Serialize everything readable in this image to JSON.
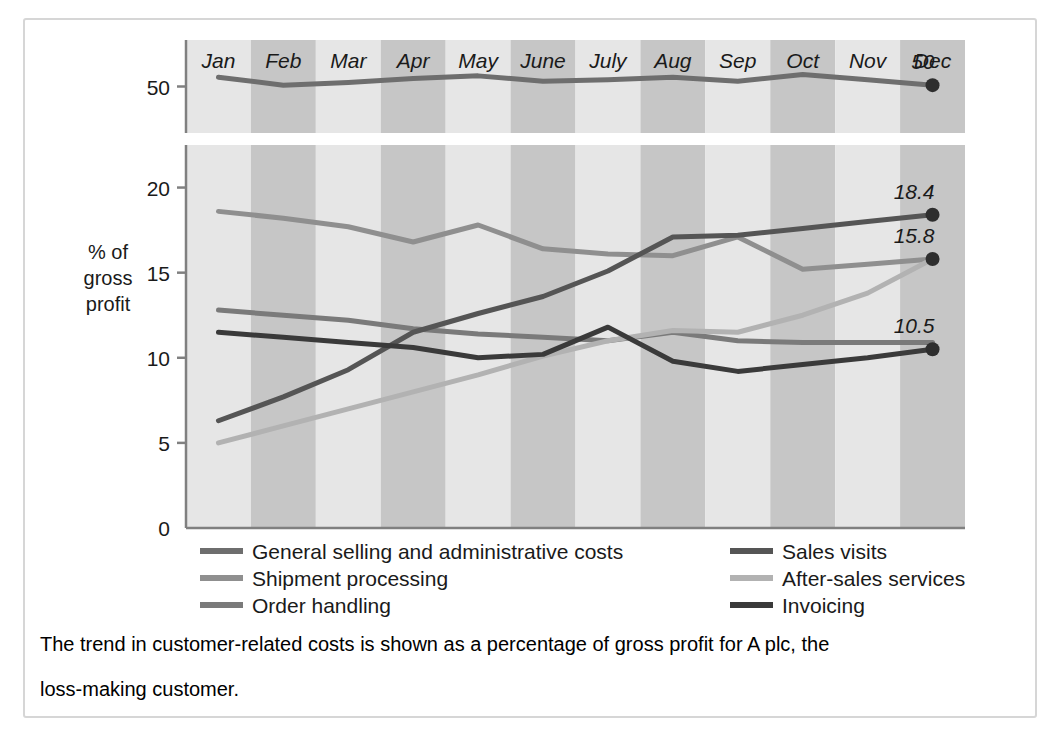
{
  "frame": {
    "border_color": "#d6d6d6",
    "background": "#ffffff"
  },
  "chart_data": {
    "type": "line",
    "title": "",
    "xlabel": "",
    "ylabel": "% of gross profit",
    "ylabel_lines": [
      "% of",
      "gross",
      "profit"
    ],
    "categories": [
      "Jan",
      "Feb",
      "Mar",
      "Apr",
      "May",
      "June",
      "July",
      "Aug",
      "Sep",
      "Oct",
      "Nov",
      "Dec"
    ],
    "grid": false,
    "legend_position": "bottom",
    "broken_axis": true,
    "upper_panel": {
      "ticks": [
        50
      ],
      "ymin": 46.5,
      "ymax": 53.5
    },
    "lower_panel": {
      "ticks": [
        0,
        5,
        10,
        15,
        20
      ],
      "ymin": 0,
      "ymax": 22.5
    },
    "band_colors": {
      "light": "#e6e6e6",
      "dark": "#c6c6c6"
    },
    "series": [
      {
        "name": "General selling and administrative costs",
        "color": "#6e6e6e",
        "width": 5,
        "panel": "upper",
        "values": [
          50.7,
          50.1,
          50.3,
          50.6,
          50.8,
          50.4,
          50.5,
          50.7,
          50.4,
          50.9,
          50.5,
          50.1
        ],
        "end_label": "50"
      },
      {
        "name": "Shipment processing",
        "color": "#8f8f8f",
        "width": 5,
        "panel": "lower",
        "values": [
          18.6,
          18.2,
          17.7,
          16.8,
          17.8,
          16.4,
          16.1,
          16.0,
          17.1,
          15.2,
          15.5,
          15.8
        ],
        "end_label": ""
      },
      {
        "name": "Order handling",
        "color": "#7a7a7a",
        "width": 5,
        "panel": "lower",
        "values": [
          12.8,
          12.5,
          12.2,
          11.7,
          11.4,
          11.2,
          11.0,
          11.5,
          11.0,
          10.9,
          10.9,
          10.9
        ],
        "end_label": ""
      },
      {
        "name": "Sales visits",
        "color": "#555555",
        "width": 5,
        "panel": "lower",
        "values": [
          6.3,
          7.7,
          9.3,
          11.5,
          12.6,
          13.6,
          15.1,
          17.1,
          17.2,
          17.6,
          18.0,
          18.4
        ],
        "end_label": "18.4"
      },
      {
        "name": "After-sales services",
        "color": "#b2b2b2",
        "width": 5,
        "panel": "lower",
        "values": [
          5.0,
          6.0,
          7.0,
          8.0,
          9.0,
          10.1,
          11.0,
          11.6,
          11.5,
          12.5,
          13.8,
          15.8
        ],
        "end_label": "15.8"
      },
      {
        "name": "Invoicing",
        "color": "#3a3a3a",
        "width": 5,
        "panel": "lower",
        "values": [
          11.5,
          11.2,
          10.9,
          10.6,
          10.0,
          10.2,
          11.8,
          9.8,
          9.2,
          9.6,
          10.0,
          10.5
        ],
        "end_label": "10.5"
      }
    ],
    "end_labels": [
      {
        "text": "50",
        "series": "General selling and administrative costs"
      },
      {
        "text": "18.4",
        "series": "Sales visits"
      },
      {
        "text": "15.8",
        "series": "After-sales services"
      },
      {
        "text": "10.5",
        "series": "Invoicing"
      }
    ]
  },
  "legend": {
    "columns": [
      [
        {
          "label": "General selling and administrative costs",
          "color": "#6e6e6e"
        },
        {
          "label": "Shipment processing",
          "color": "#8f8f8f"
        },
        {
          "label": "Order handling",
          "color": "#7a7a7a"
        }
      ],
      [
        {
          "label": "Sales visits",
          "color": "#555555"
        },
        {
          "label": "After-sales services",
          "color": "#b2b2b2"
        },
        {
          "label": "Invoicing",
          "color": "#3a3a3a"
        }
      ]
    ]
  },
  "caption": {
    "line1": "The trend in customer-related costs is shown as a percentage of gross profit for A plc, the",
    "line2": "loss-making customer."
  }
}
